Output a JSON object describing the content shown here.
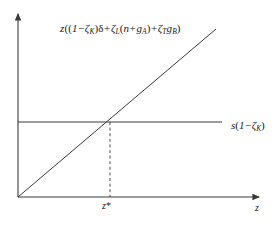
{
  "figure": {
    "type": "economics-diagram",
    "background_color": "#ffffff",
    "line_color": "#3a3a3a",
    "text_color": "#1a1a1a",
    "labels": {
      "curve_equation": "z((1−ζK)δ+ζL(n+gA)+ζTgB)",
      "savings_line": "s(1−ζK)",
      "equilibrium_tick": "z*",
      "x_axis": "z"
    },
    "axes": {
      "origin": {
        "x": 18,
        "y": 197
      },
      "x_axis_end": {
        "x": 264,
        "y": 197
      },
      "y_axis_top": {
        "x": 18,
        "y": 10
      }
    },
    "series": [
      {
        "name": "break-even-investment-line",
        "kind": "line",
        "from": {
          "x": 18,
          "y": 197
        },
        "to": {
          "x": 216,
          "y": 29
        },
        "style": "solid"
      },
      {
        "name": "actual-savings-line",
        "kind": "line",
        "from": {
          "x": 18,
          "y": 122
        },
        "to": {
          "x": 222,
          "y": 122
        },
        "style": "solid"
      },
      {
        "name": "equilibrium-dropline",
        "kind": "line",
        "from": {
          "x": 110,
          "y": 122
        },
        "to": {
          "x": 110,
          "y": 197
        },
        "style": "dashed"
      }
    ],
    "equilibrium_point": {
      "x": 110,
      "y": 122
    }
  }
}
